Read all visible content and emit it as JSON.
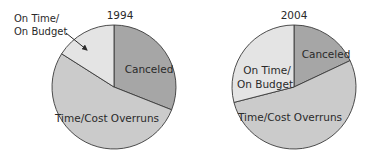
{
  "chart_data": [
    {
      "type": "pie",
      "title": "1994",
      "categories": [
        "On Time/On Budget",
        "Canceled",
        "Time/Cost Overruns"
      ],
      "values": [
        16,
        31,
        53
      ],
      "colors": [
        "#e4e4e4",
        "#a6a6a6",
        "#cbcbcb"
      ],
      "annotations": [
        {
          "text": "On Time/ On Budget",
          "arrow": true
        }
      ]
    },
    {
      "type": "pie",
      "title": "2004",
      "categories": [
        "On Time/On Budget",
        "Canceled",
        "Time/Cost Overruns"
      ],
      "values": [
        29,
        18,
        53
      ],
      "colors": [
        "#e4e4e4",
        "#a6a6a6",
        "#cbcbcb"
      ]
    }
  ],
  "labels": {
    "p1994": {
      "title": "1994",
      "ontime_line1": "On Time/",
      "ontime_line2": "On Budget",
      "canceled": "Canceled",
      "overruns": "Time/Cost Overruns"
    },
    "p2004": {
      "title": "2004",
      "ontime_line1": "On Time/",
      "ontime_line2": "On Budget",
      "canceled": "Canceled",
      "overruns": "Time/Cost Overruns"
    }
  }
}
